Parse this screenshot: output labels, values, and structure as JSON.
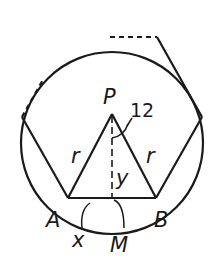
{
  "diagram": {
    "labels": {
      "center": "P",
      "vertex_a": "A",
      "vertex_b": "B",
      "midpoint": "M",
      "side_left": "r",
      "side_right": "r",
      "apothem": "y",
      "half_chord": "x",
      "angle": "12"
    },
    "colors": {
      "stroke": "#1a1a1a",
      "background": "#ffffff"
    }
  }
}
